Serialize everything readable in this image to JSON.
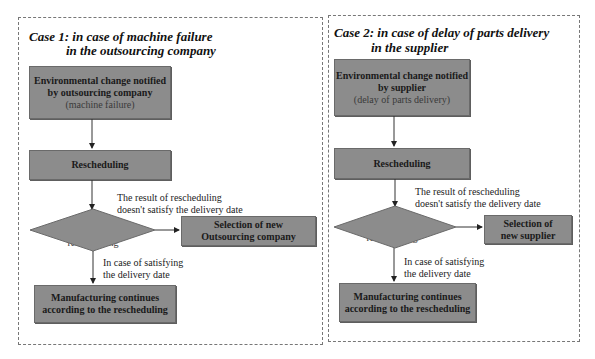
{
  "case1": {
    "title_line1": "Case 1: in case of machine failure",
    "title_line2": "in the outsourcing company",
    "notify_box": {
      "line1": "Environmental change notified",
      "line2": "by outsourcing company",
      "sub": "(machine failure)"
    },
    "reschedule_box": "Rescheduling",
    "decision": {
      "line1": "Analysis of",
      "line2": "rescheduling"
    },
    "fail_label": {
      "line1": "The result of rescheduling",
      "line2": "doesn't satisfy the delivery date"
    },
    "select_box": {
      "line1": "Selection of new",
      "line2": "Outsourcing company"
    },
    "ok_label": {
      "line1": "In case of satisfying",
      "line2": "the delivery date"
    },
    "continue_box": {
      "line1": "Manufacturing continues",
      "line2": "according to the rescheduling"
    }
  },
  "case2": {
    "title_line1": "Case 2: in case of delay of parts delivery",
    "title_line2": "in the supplier",
    "notify_box": {
      "line1": "Environmental change notified",
      "line2": "by supplier",
      "sub": "(delay of parts delivery)"
    },
    "reschedule_box": "Rescheduling",
    "decision": {
      "line1": "Analysis of",
      "line2": "rescheduling"
    },
    "fail_label": {
      "line1": "The result of rescheduling",
      "line2": "doesn't satisfy the delivery date"
    },
    "select_box": {
      "line1": "Selection of",
      "line2": "new supplier"
    },
    "ok_label": {
      "line1": "In case of satisfying",
      "line2": "the delivery date"
    },
    "continue_box": {
      "line1": "Manufacturing continues",
      "line2": "according to the rescheduling"
    }
  },
  "colors": {
    "box_fill": "#8c8c8c",
    "border": "#777777"
  }
}
